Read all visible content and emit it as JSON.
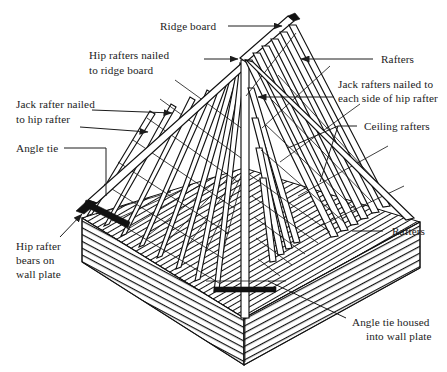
{
  "figure": {
    "type": "technical-line-diagram",
    "background_color": "#ffffff",
    "ink_color": "#111111",
    "label_color": "#1c1c1c"
  },
  "labels": {
    "ridge_board": "Ridge board",
    "hip_rafters_nailed_1": "Hip rafters nailed",
    "hip_rafters_nailed_2": "to ridge board",
    "rafters_top_right": "Rafters",
    "jack_rafters_each_side_1": "Jack rafters nailed to",
    "jack_rafters_each_side_2": "each side of hip rafter",
    "ceiling_rafters": "Ceiling rafters",
    "jack_rafter_nailed_1": "Jack rafter nailed",
    "jack_rafter_nailed_2": "to hip rafter",
    "angle_tie": "Angle tie",
    "hip_rafter_bears_1": "Hip rafter",
    "hip_rafter_bears_2": "bears on",
    "hip_rafter_bears_3": "wall plate",
    "rafters_right": "Rafters",
    "angle_tie_housed_1": "Angle tie housed",
    "angle_tie_housed_2": "into wall plate"
  },
  "callouts": [
    {
      "name": "ridge-board",
      "text": "Ridge board",
      "anchor": "top-center",
      "arrow": true
    },
    {
      "name": "hip-rafters-nailed-to-ridge-board",
      "text": "Hip rafters nailed to ridge board",
      "anchor": "top-left",
      "arrow": true
    },
    {
      "name": "rafters-top-right",
      "text": "Rafters",
      "anchor": "top-right",
      "arrow": true
    },
    {
      "name": "jack-rafters-nailed-to-each-side-of-hip-rafter",
      "text": "Jack rafters nailed to each side of hip rafter",
      "anchor": "right",
      "arrow": true
    },
    {
      "name": "ceiling-rafters",
      "text": "Ceiling rafters",
      "anchor": "right",
      "arrow": false
    },
    {
      "name": "jack-rafter-nailed-to-hip-rafter",
      "text": "Jack rafter nailed to hip rafter",
      "anchor": "left",
      "arrow": true
    },
    {
      "name": "angle-tie",
      "text": "Angle tie",
      "anchor": "left",
      "arrow": false
    },
    {
      "name": "hip-rafter-bears-on-wall-plate",
      "text": "Hip rafter bears on wall plate",
      "anchor": "bottom-left",
      "arrow": true
    },
    {
      "name": "rafters-right",
      "text": "Rafters",
      "anchor": "bottom-right",
      "arrow": false
    },
    {
      "name": "angle-tie-housed-into-wall-plate",
      "text": "Angle tie housed into wall plate",
      "anchor": "bottom-right",
      "arrow": false
    }
  ]
}
